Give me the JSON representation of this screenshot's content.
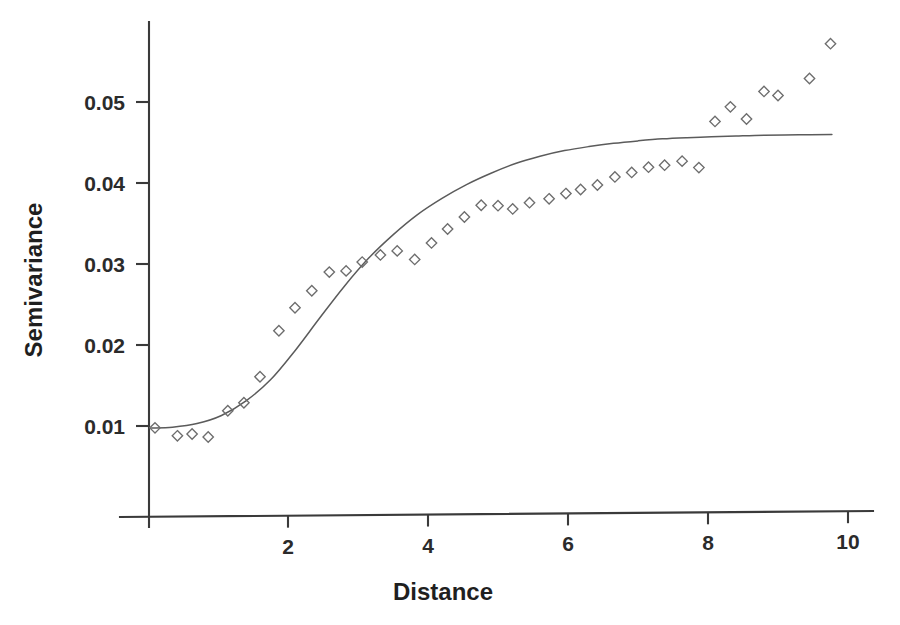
{
  "chart_data": {
    "type": "scatter",
    "title": "",
    "xlabel": "Distance",
    "ylabel": "Semivariance",
    "xlim": [
      0,
      10.35
    ],
    "ylim": [
      0.0088,
      0.0602
    ],
    "grid": false,
    "legend": null,
    "x_ticks": [
      2,
      4,
      6,
      8,
      10
    ],
    "x_tick_labels": [
      "2",
      "4",
      "6",
      "8",
      "10"
    ],
    "y_ticks": [
      0.01,
      0.02,
      0.03,
      0.04,
      0.05
    ],
    "y_tick_labels": [
      "0.01",
      "0.02",
      "0.03",
      "0.04",
      "0.05"
    ],
    "marker": "diamond-open",
    "marker_color": "#6d6d6d",
    "line_color": "#5b5b5b",
    "axis_color": "#3a3a3a",
    "series": [
      {
        "name": "Empirical semivariance",
        "type": "scatter",
        "points": [
          [
            0.1,
            0.00977
          ],
          [
            0.42,
            0.00879
          ],
          [
            0.63,
            0.00901
          ],
          [
            0.86,
            0.00864
          ],
          [
            1.14,
            0.01188
          ],
          [
            1.37,
            0.01287
          ],
          [
            1.6,
            0.01608
          ],
          [
            1.87,
            0.02176
          ],
          [
            2.1,
            0.0246
          ],
          [
            2.34,
            0.0267
          ],
          [
            2.59,
            0.029
          ],
          [
            2.83,
            0.02915
          ],
          [
            3.06,
            0.03024
          ],
          [
            3.32,
            0.03112
          ],
          [
            3.56,
            0.03162
          ],
          [
            3.81,
            0.03056
          ],
          [
            4.05,
            0.0326
          ],
          [
            4.28,
            0.03432
          ],
          [
            4.52,
            0.0358
          ],
          [
            4.76,
            0.03725
          ],
          [
            5.0,
            0.0372
          ],
          [
            5.21,
            0.0368
          ],
          [
            5.45,
            0.03757
          ],
          [
            5.73,
            0.03805
          ],
          [
            5.97,
            0.0387
          ],
          [
            6.18,
            0.0392
          ],
          [
            6.42,
            0.03975
          ],
          [
            6.67,
            0.04075
          ],
          [
            6.91,
            0.0413
          ],
          [
            7.15,
            0.04195
          ],
          [
            7.38,
            0.0422
          ],
          [
            7.63,
            0.0427
          ],
          [
            7.87,
            0.0419
          ],
          [
            8.1,
            0.0476
          ],
          [
            8.32,
            0.0494
          ],
          [
            8.55,
            0.0479
          ],
          [
            8.8,
            0.0513
          ],
          [
            9.0,
            0.0508
          ],
          [
            9.45,
            0.0529
          ],
          [
            9.75,
            0.0572
          ]
        ]
      },
      {
        "name": "Fitted model",
        "type": "line",
        "points": [
          [
            0.05,
            0.00975
          ],
          [
            0.35,
            0.00985
          ],
          [
            0.7,
            0.0103
          ],
          [
            1.05,
            0.0113
          ],
          [
            1.4,
            0.0131
          ],
          [
            1.75,
            0.0157
          ],
          [
            2.1,
            0.0193
          ],
          [
            2.45,
            0.0233
          ],
          [
            2.8,
            0.0272
          ],
          [
            3.15,
            0.0307
          ],
          [
            3.5,
            0.0336
          ],
          [
            3.85,
            0.0361
          ],
          [
            4.2,
            0.0381
          ],
          [
            4.55,
            0.0398
          ],
          [
            4.9,
            0.0412
          ],
          [
            5.25,
            0.0424
          ],
          [
            5.6,
            0.0433
          ],
          [
            5.95,
            0.044
          ],
          [
            6.3,
            0.0445
          ],
          [
            6.65,
            0.0449
          ],
          [
            7.0,
            0.0452
          ],
          [
            7.35,
            0.04545
          ],
          [
            7.7,
            0.0456
          ],
          [
            8.05,
            0.0457
          ],
          [
            8.4,
            0.0458
          ],
          [
            8.8,
            0.0459
          ],
          [
            9.3,
            0.04595
          ],
          [
            9.77,
            0.046
          ]
        ]
      }
    ]
  }
}
